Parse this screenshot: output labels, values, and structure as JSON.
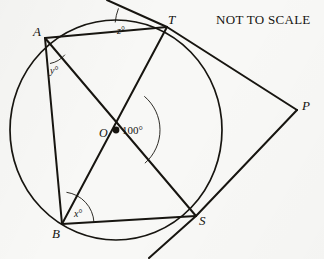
{
  "figure": {
    "caption": "NOT TO SCALE",
    "stroke_color": "#171510",
    "background_color": "#f8f8f6",
    "canvas": {
      "width": 324,
      "height": 259
    }
  },
  "circle": {
    "center_label": "O",
    "center": {
      "x": 116,
      "y": 130
    },
    "radius": 106,
    "center_dot": true
  },
  "points": [
    {
      "id": "A",
      "label": "A",
      "x": 45,
      "y": 38,
      "label_x": 33,
      "label_y": 25,
      "on_circle": true
    },
    {
      "id": "T",
      "label": "T",
      "x": 167,
      "y": 27,
      "label_x": 168,
      "label_y": 13,
      "on_circle": true
    },
    {
      "id": "S",
      "label": "S",
      "x": 196,
      "y": 216,
      "label_x": 199,
      "label_y": 214,
      "on_circle": true
    },
    {
      "id": "B",
      "label": "B",
      "x": 62,
      "y": 224,
      "label_x": 52,
      "label_y": 227,
      "on_circle": true
    },
    {
      "id": "O",
      "label": "O",
      "x": 116,
      "y": 130,
      "label_x": 99,
      "label_y": 127,
      "on_circle": false
    },
    {
      "id": "P",
      "label": "P",
      "x": 297,
      "y": 110,
      "label_x": 302,
      "label_y": 99,
      "on_circle": false
    }
  ],
  "chords": [
    {
      "name": "AT",
      "from": "A",
      "to": "T"
    },
    {
      "name": "AB",
      "from": "A",
      "to": "B"
    },
    {
      "name": "BS",
      "from": "B",
      "to": "S"
    },
    {
      "name": "AS",
      "from": "A",
      "to": "S"
    },
    {
      "name": "TB",
      "from": "T",
      "to": "B"
    }
  ],
  "tangents": [
    {
      "name": "tangent-at-T",
      "touch_point": "T",
      "to": "P",
      "extend_x": 107,
      "extend_y": 0
    },
    {
      "name": "tangent-at-S",
      "touch_point": "S",
      "to": "P",
      "extend_x": 149,
      "extend_y": 258
    }
  ],
  "angles": [
    {
      "id": "z",
      "label_value": "z",
      "label_unit": "°",
      "vertex": "T",
      "between": [
        "tangent-at-T-extension",
        "TA"
      ],
      "label_x": 117,
      "label_y": 26,
      "arc_radius": 52,
      "start_deg": 185,
      "end_deg": 201
    },
    {
      "id": "y",
      "label_value": "y",
      "label_unit": "°",
      "vertex": "A",
      "between": [
        "AB",
        "AS"
      ],
      "label_x": 50,
      "label_y": 66,
      "arc_radius": 26,
      "start_deg": 40,
      "end_deg": 79
    },
    {
      "id": "center",
      "label_value": "100",
      "label_unit": "°",
      "vertex": "O",
      "between": [
        "OT",
        "OS"
      ],
      "label_x": 122,
      "label_y": 125,
      "arc_radius": 44,
      "start_deg": -50,
      "end_deg": 49
    },
    {
      "id": "x",
      "label_value": "x",
      "label_unit": "°",
      "vertex": "B",
      "between": [
        "BA",
        "BS"
      ],
      "label_x": 74,
      "label_y": 209,
      "arc_radius": 32,
      "start_deg": -82,
      "end_deg": -3
    }
  ],
  "caption_position": {
    "x": 216,
    "y": 12
  }
}
